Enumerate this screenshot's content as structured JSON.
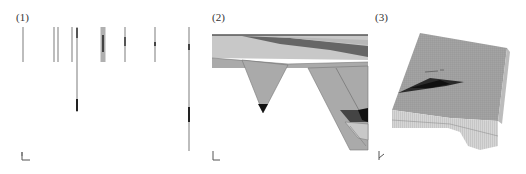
{
  "figure": {
    "panels": [
      {
        "label": "(1)",
        "content": "well-log columns",
        "wells": [
          {
            "x": 23,
            "top": 27,
            "bottom": 62,
            "segments": []
          },
          {
            "x": 54,
            "top": 27,
            "bottom": 62,
            "segments": []
          },
          {
            "x": 58,
            "top": 27,
            "bottom": 62,
            "segments": []
          },
          {
            "x": 72,
            "top": 27,
            "bottom": 62,
            "segments": []
          },
          {
            "x": 77,
            "top": 27,
            "bottom": 112,
            "segments": [
              {
                "from": 28,
                "to": 38,
                "shade": "#555"
              },
              {
                "from": 99,
                "to": 111,
                "shade": "#222"
              }
            ]
          },
          {
            "x": 103,
            "top": 27,
            "bottom": 62,
            "wide": true,
            "segments": [
              {
                "from": 35,
                "to": 52,
                "shade": "#444"
              }
            ]
          },
          {
            "x": 125,
            "top": 27,
            "bottom": 62,
            "segments": [
              {
                "from": 37,
                "to": 46,
                "shade": "#555"
              }
            ]
          },
          {
            "x": 155,
            "top": 27,
            "bottom": 62,
            "segments": [
              {
                "from": 42,
                "to": 46,
                "shade": "#444"
              }
            ]
          },
          {
            "x": 189,
            "top": 27,
            "bottom": 151,
            "segments": [
              {
                "from": 44,
                "to": 50,
                "shade": "#444"
              },
              {
                "from": 107,
                "to": 122,
                "shade": "#222"
              }
            ]
          }
        ]
      },
      {
        "label": "(2)",
        "content": "geological cross-section with channel incisions"
      },
      {
        "label": "(3)",
        "content": "3D gridded reservoir block with dark lens body"
      }
    ],
    "colors": {
      "light_gray": "#c8c8c8",
      "mid_gray": "#a8a8a8",
      "dark_gray": "#555555",
      "black": "#111111"
    }
  }
}
